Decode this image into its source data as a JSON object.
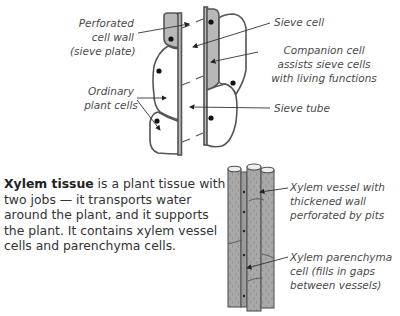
{
  "phloem_diagram": {
    "labels": {
      "perforated_wall": [
        "Perforated",
        "cell wall",
        "(sieve plate)"
      ],
      "ordinary_cells": [
        "Ordinary",
        "plant cells"
      ],
      "sieve_cell": "Sieve cell",
      "companion_cell": [
        "Companion cell",
        "assists sieve cells",
        "with living functions"
      ],
      "sieve_tube": "Sieve tube"
    }
  },
  "xylem_text": {
    "bold": "Xylem tissue",
    "rest": " is a plant tissue with two jobs — it transports water around the plant, and it supports the plant.  It contains xylem vessel cells and parenchyma cells."
  },
  "xylem_diagram": {
    "labels": {
      "vessel": [
        "Xylem vessel with",
        "thickened wall",
        "perforated by pits"
      ],
      "parenchyma": [
        "Xylem parenchyma",
        "cell (fills in gaps",
        "between vessels)"
      ]
    }
  },
  "colors": {
    "cell_fill_gray": "#b8b8b8",
    "outline": "#555555",
    "xylem_fill": "#a9a9a9"
  }
}
